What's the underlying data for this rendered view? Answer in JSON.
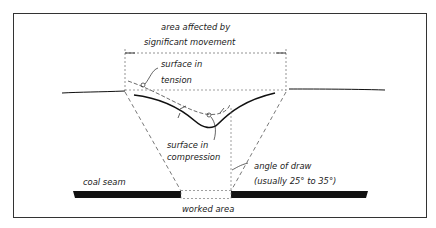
{
  "diagram": {
    "type": "mining subsidence cross-section",
    "labels": {
      "area_affected_line1": "area affected by",
      "area_affected_line2": "significant movement",
      "surface_tension_line1": "surface in",
      "surface_tension_line2": "tension",
      "surface_compression_line1": "surface in",
      "surface_compression_line2": "compression",
      "angle_of_draw_line1": "angle of draw",
      "angle_of_draw_line2": "(usually 25° to 35°)",
      "coal_seam": "coal seam",
      "worked_area": "worked area"
    },
    "colors": {
      "ink": "#1a1a1a",
      "frame": "#333333",
      "dashed": "#555555",
      "background": "#ffffff"
    }
  }
}
